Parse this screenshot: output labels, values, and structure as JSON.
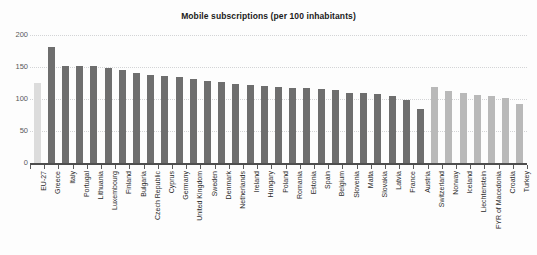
{
  "clipped_top_text": {
    "left": "",
    "middle": "",
    "right": ""
  },
  "chart_data": {
    "type": "bar",
    "title": "Mobile subscriptions (per 100 inhabitants)",
    "xlabel": "",
    "ylabel": "",
    "ylim": [
      0,
      200
    ],
    "ytick_values": [
      0,
      50,
      100,
      150,
      200
    ],
    "ytick_labels": [
      "0",
      "50",
      "100",
      "150",
      "200"
    ],
    "grid": true,
    "grid_axis": "y",
    "legend": "none",
    "series_name": "Mobile subscriptions",
    "colors": {
      "eu_aggregate": "#dcdcdc",
      "eu_member": "#6e6e6e",
      "non_eu": "#b9b9b9",
      "axis": "#4e4e4e",
      "gridline": "#d3d4d6",
      "text": "#2b2b2b",
      "background": "#fdfdfd"
    },
    "categories": [
      "EU-27",
      "Greece",
      "Italy",
      "Portugal",
      "Lithuania",
      "Luxembourg",
      "Finland",
      "Bulgaria",
      "Czech Republic",
      "Cyprus",
      "Germany",
      "United Kingdom",
      "Sweden",
      "Denmark",
      "Netherlands",
      "Ireland",
      "Hungary",
      "Poland",
      "Romania",
      "Estonia",
      "Spain",
      "Belgium",
      "Slovenia",
      "Malta",
      "Slovakia",
      "Latvia",
      "France",
      "Austria",
      "Switzerland",
      "Norway",
      "Iceland",
      "Liechtenstein",
      "FYR of Macedonia",
      "Croatia",
      "Turkey"
    ],
    "values": [
      125,
      181,
      152,
      151,
      151,
      148,
      145,
      141,
      138,
      136,
      134,
      131,
      128,
      126,
      124,
      122,
      120,
      118,
      117,
      117,
      116,
      114,
      110,
      109,
      108,
      104,
      98,
      84,
      119,
      113,
      109,
      106,
      104,
      101,
      92
    ],
    "groups": [
      "eu_aggregate",
      "eu_member",
      "eu_member",
      "eu_member",
      "eu_member",
      "eu_member",
      "eu_member",
      "eu_member",
      "eu_member",
      "eu_member",
      "eu_member",
      "eu_member",
      "eu_member",
      "eu_member",
      "eu_member",
      "eu_member",
      "eu_member",
      "eu_member",
      "eu_member",
      "eu_member",
      "eu_member",
      "eu_member",
      "eu_member",
      "eu_member",
      "eu_member",
      "eu_member",
      "eu_member",
      "eu_member",
      "non_eu",
      "non_eu",
      "non_eu",
      "non_eu",
      "non_eu",
      "non_eu",
      "non_eu"
    ]
  }
}
